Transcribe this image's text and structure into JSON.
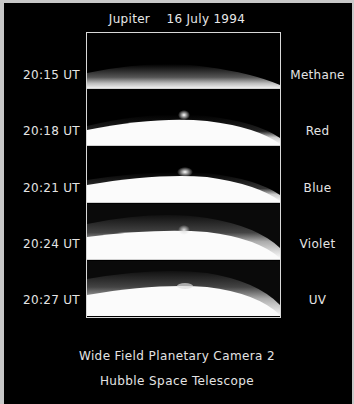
{
  "header": {
    "title": "Jupiter    16 July 1994"
  },
  "panels": [
    {
      "time": "20:15 UT",
      "filter": "Methane",
      "impact_plume_visible": false
    },
    {
      "time": "20:18 UT",
      "filter": "Red",
      "impact_plume_visible": true
    },
    {
      "time": "20:21 UT",
      "filter": "Blue",
      "impact_plume_visible": true
    },
    {
      "time": "20:24 UT",
      "filter": "Violet",
      "impact_plume_visible": true
    },
    {
      "time": "20:27 UT",
      "filter": "UV",
      "impact_plume_visible": true
    }
  ],
  "footer": {
    "line1": "Wide Field Planetary Camera 2",
    "line2": "Hubble Space Telescope"
  },
  "colors": {
    "background": "#000000",
    "text": "#e4e4e4",
    "border": "#c8c8c8"
  }
}
